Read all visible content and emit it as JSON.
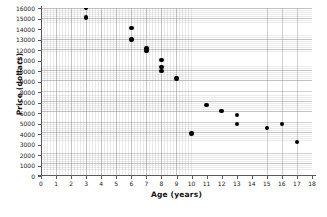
{
  "chart_data": {
    "type": "scatter",
    "title": "",
    "xlabel": "Age  (years)",
    "ylabel": "Price  (dollars)",
    "xlim": [
      0,
      18
    ],
    "ylim": [
      0,
      16000
    ],
    "xticks": [
      0,
      1,
      2,
      3,
      4,
      5,
      6,
      7,
      8,
      9,
      10,
      11,
      12,
      13,
      14,
      15,
      16,
      17,
      18
    ],
    "xtick_labels": [
      "0",
      "1",
      "2",
      "3",
      "4",
      "5",
      "6",
      "7",
      "8",
      "9",
      "10",
      "11",
      "12",
      "13",
      "14",
      "15",
      "16",
      "17",
      "18"
    ],
    "yticks": [
      0,
      1000,
      2000,
      3000,
      4000,
      5000,
      6000,
      7000,
      8000,
      9000,
      10000,
      11000,
      12000,
      13000,
      14000,
      15000,
      16000
    ],
    "ytick_labels": [
      "0",
      "1000",
      "2000",
      "3000",
      "4000",
      "5000",
      "6000",
      "7000",
      "8000",
      "9000",
      "10000",
      "11000",
      "12000",
      "13000",
      "14000",
      "15000",
      "16000"
    ],
    "grid": true,
    "grid_minor": true,
    "legend": null,
    "marker_color": "#000000",
    "points": [
      {
        "x": 3,
        "y": 16000
      },
      {
        "x": 3,
        "y": 15100
      },
      {
        "x": 6,
        "y": 14100
      },
      {
        "x": 6,
        "y": 13000
      },
      {
        "x": 7,
        "y": 12150
      },
      {
        "x": 7,
        "y": 11900
      },
      {
        "x": 8,
        "y": 11050
      },
      {
        "x": 8,
        "y": 10400
      },
      {
        "x": 8,
        "y": 10000
      },
      {
        "x": 9,
        "y": 9300
      },
      {
        "x": 10,
        "y": 4050
      },
      {
        "x": 11,
        "y": 6750
      },
      {
        "x": 12,
        "y": 6200
      },
      {
        "x": 13,
        "y": 5800
      },
      {
        "x": 13,
        "y": 4950
      },
      {
        "x": 15,
        "y": 4600
      },
      {
        "x": 16,
        "y": 4950
      },
      {
        "x": 17,
        "y": 3250
      }
    ]
  }
}
